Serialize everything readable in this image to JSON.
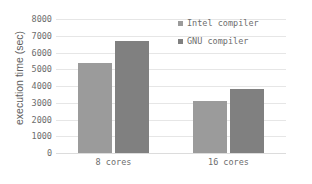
{
  "chart_data": {
    "type": "bar",
    "title": "",
    "xlabel": "",
    "ylabel": "execution time (sec)",
    "categories": [
      "8 cores",
      "16 cores"
    ],
    "series": [
      {
        "name": "Intel compiler",
        "values": [
          5400,
          3100
        ],
        "color": "#9b9b9b"
      },
      {
        "name": "GNU compiler",
        "values": [
          6700,
          3850
        ],
        "color": "#808080"
      }
    ],
    "ylim": [
      0,
      8000
    ],
    "ytick_labels": [
      "0",
      "1000",
      "2000",
      "3000",
      "4000",
      "5000",
      "6000",
      "7000",
      "8000"
    ],
    "ytick_values": [
      0,
      1000,
      2000,
      3000,
      4000,
      5000,
      6000,
      7000,
      8000
    ],
    "grid": true,
    "legend_position": "top-right"
  },
  "legend": {
    "entries": [
      {
        "label": "Intel compiler",
        "swatch": "legend-swatch-intel"
      },
      {
        "label": "GNU compiler",
        "swatch": "legend-swatch-gnu"
      }
    ]
  }
}
